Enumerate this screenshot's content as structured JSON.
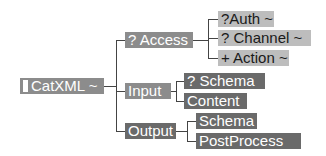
{
  "diagram": {
    "root": {
      "label": "CatXML ~",
      "marker": "bar"
    },
    "level1": [
      {
        "label": "? Access"
      },
      {
        "label": "Input"
      },
      {
        "label": "Output"
      }
    ],
    "access_children": [
      {
        "label": "?Auth ~"
      },
      {
        "label": "? Channel ~"
      },
      {
        "label": "+ Action ~"
      }
    ],
    "input_children": [
      {
        "label": "? Schema"
      },
      {
        "label": "Content"
      }
    ],
    "output_children": [
      {
        "label": "Schema"
      },
      {
        "label": "PostProcess"
      }
    ],
    "colors": {
      "mid": "#8c8c8c",
      "dark": "#6a6a6a",
      "light": "#bdbdbd",
      "line": "#444444"
    }
  }
}
